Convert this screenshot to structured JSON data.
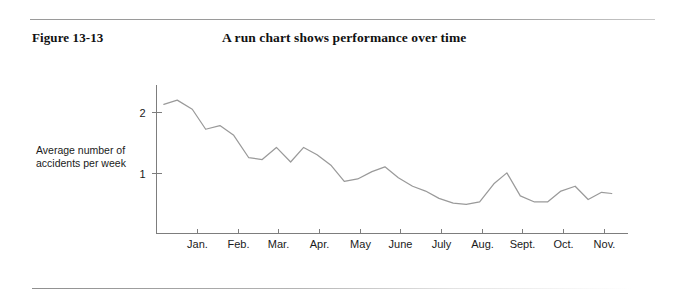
{
  "figure": {
    "label": "Figure 13-13",
    "title": "A run chart shows performance over time"
  },
  "chart_data": {
    "type": "line",
    "title": "A run chart shows performance over time",
    "xlabel": "",
    "ylabel": "Average number of accidents per week",
    "categories": [
      "Jan.",
      "Feb.",
      "Mar.",
      "Apr.",
      "May",
      "June",
      "July",
      "Aug.",
      "Sept.",
      "Oct.",
      "Nov."
    ],
    "ytick_labels": [
      "1",
      "2"
    ],
    "ytick_values": [
      1,
      2
    ],
    "ylim": [
      0,
      2.45
    ],
    "xlim": [
      0,
      11.6
    ],
    "grid": false,
    "legend": null,
    "series": [
      {
        "name": "Average number of accidents per week",
        "x": [
          0.18,
          0.51,
          0.88,
          1.21,
          1.56,
          1.9,
          2.27,
          2.6,
          2.95,
          3.3,
          3.62,
          3.95,
          4.3,
          4.62,
          4.95,
          5.3,
          5.62,
          5.95,
          6.3,
          6.62,
          6.95,
          7.3,
          7.62,
          7.95,
          8.3,
          8.62,
          8.95,
          9.3,
          9.62,
          9.95,
          10.3,
          10.62,
          10.95,
          11.2
        ],
        "values": [
          2.13,
          2.2,
          2.05,
          1.72,
          1.78,
          1.62,
          1.25,
          1.22,
          1.42,
          1.18,
          1.42,
          1.3,
          1.12,
          0.86,
          0.9,
          1.02,
          1.1,
          0.92,
          0.78,
          0.7,
          0.58,
          0.5,
          0.48,
          0.52,
          0.82,
          1.0,
          0.62,
          0.52,
          0.52,
          0.7,
          0.78,
          0.56,
          0.68,
          0.66
        ]
      }
    ],
    "colors": {
      "line": "#9a9a9a",
      "axis": "#7d7d7d",
      "text": "#1a1a1a"
    }
  }
}
